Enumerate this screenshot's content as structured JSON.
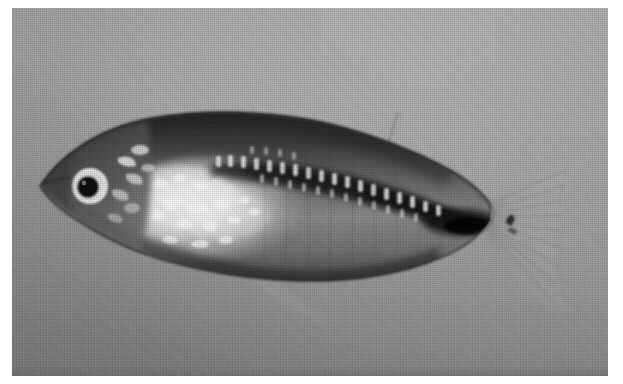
{
  "image": {
    "kind": "photograph",
    "medium": "halftone-printed grayscale plate",
    "subject": "small freshwater fish (medaka / ricefish, lateral view)",
    "orientation": "facing left",
    "caption": "",
    "width_px": 623,
    "height_px": 384
  },
  "plate": {
    "left_px": 12,
    "top_px": 8,
    "width_px": 596,
    "height_px": 368,
    "page_background": "#ffffff",
    "background_light": "#dedede",
    "background_mid": "#cbcbcb",
    "background_dark": "#a8a8a8",
    "bottom_edge_line": "#9a9a9a"
  },
  "subject": {
    "name": "fish",
    "body_dark": "#3a3a3a",
    "body_mid": "#6f6f6f",
    "body_light": "#b9b9b9",
    "belly_highlight": "#f4f4f4",
    "stripe_color": "#1d1d1d",
    "fin_tint": "#b4b4b4",
    "eye_pupil": "#141414",
    "eye_ring": "#f2f2f2",
    "snout_tip_x": 40,
    "caudal_tip_x": 575,
    "body_top_y": 118,
    "body_bottom_y": 268
  },
  "parts": [
    {
      "id": "head",
      "label": "head"
    },
    {
      "id": "eye",
      "label": "eye"
    },
    {
      "id": "eye-ring",
      "label": "eye ring"
    },
    {
      "id": "operculum",
      "label": "operculum / gill cover"
    },
    {
      "id": "dorsal-back",
      "label": "dark dorsal surface"
    },
    {
      "id": "lateral-stripe",
      "label": "dark lateral stripe"
    },
    {
      "id": "scale-speckles",
      "label": "reflective scale speckles"
    },
    {
      "id": "belly-patch",
      "label": "bright ventral patch"
    },
    {
      "id": "dorsal-fin",
      "label": "dorsal fin"
    },
    {
      "id": "anal-fin",
      "label": "anal fin"
    },
    {
      "id": "pectoral-fin",
      "label": "pectoral fin"
    },
    {
      "id": "caudal-peduncle-blotch",
      "label": "caudal peduncle dark blotch"
    },
    {
      "id": "caudal-fin",
      "label": "caudal fin"
    }
  ],
  "labels": {
    "photo_alt": "Grayscale lateral photograph of a small fish on a plain gray background"
  }
}
